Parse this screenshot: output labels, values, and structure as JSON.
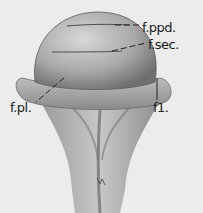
{
  "figure": {
    "background_color": "#ececec",
    "labels": [
      {
        "id": "fppd",
        "text": "f.ppd."
      },
      {
        "id": "fsec",
        "text": "f.sec."
      },
      {
        "id": "fpl",
        "text": "f.pl."
      },
      {
        "id": "f1",
        "text": "f1."
      }
    ]
  }
}
